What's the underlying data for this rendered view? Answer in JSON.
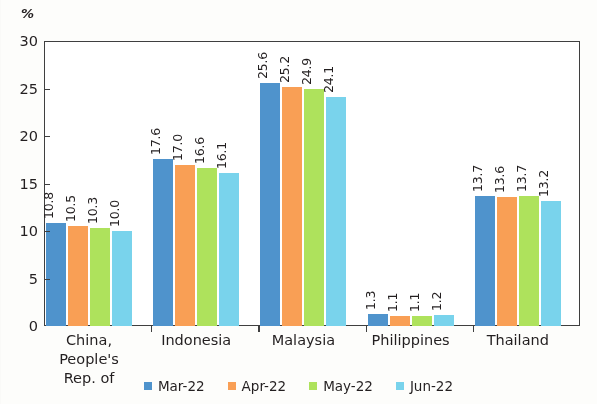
{
  "chart_data": {
    "type": "bar",
    "title": "",
    "subtitle": "",
    "xlabel": "",
    "ylabel": "%",
    "unit_label": "%",
    "ylim": [
      0,
      30
    ],
    "ytick_labels": [
      "0",
      "5",
      "10",
      "15",
      "20",
      "25",
      "30"
    ],
    "ytick_values": [
      0,
      5,
      10,
      15,
      20,
      25,
      30
    ],
    "grid": false,
    "legend_position": "bottom",
    "categories": [
      "China, People's Rep. of",
      "Indonesia",
      "Malaysia",
      "Philippines",
      "Thailand"
    ],
    "category_lines": [
      [
        "China, People's",
        "Rep. of"
      ],
      [
        "Indonesia"
      ],
      [
        "Malaysia"
      ],
      [
        "Philippines"
      ],
      [
        "Thailand"
      ]
    ],
    "series": [
      {
        "name": "Mar-22",
        "color": "#4f93cc",
        "values": [
          10.8,
          17.6,
          25.6,
          1.3,
          13.7
        ]
      },
      {
        "name": "Apr-22",
        "color": "#f99f55",
        "values": [
          10.5,
          17.0,
          25.2,
          1.1,
          13.6
        ]
      },
      {
        "name": "May-22",
        "color": "#aee25c",
        "values": [
          10.3,
          16.6,
          24.9,
          1.1,
          13.7
        ]
      },
      {
        "name": "Jun-22",
        "color": "#79d3ec",
        "values": [
          10.0,
          16.1,
          24.1,
          1.2,
          13.2
        ]
      }
    ],
    "value_labels": [
      [
        "10.8",
        "10.5",
        "10.3",
        "10.0"
      ],
      [
        "17.6",
        "17.0",
        "16.6",
        "16.1"
      ],
      [
        "25.6",
        "25.2",
        "24.9",
        "24.1"
      ],
      [
        "1.3",
        "1.1",
        "1.1",
        "1.2"
      ],
      [
        "13.7",
        "13.6",
        "13.7",
        "13.2"
      ]
    ],
    "colors": {
      "mar22": "#4f93cc",
      "apr22": "#f99f55",
      "may22": "#aee25c",
      "jun22": "#79d3ec",
      "axis": "#3f3f3f",
      "text": "#231f20",
      "background": "#ffffff"
    }
  },
  "legend": {
    "items": [
      {
        "label": "Mar-22"
      },
      {
        "label": "Apr-22"
      },
      {
        "label": "May-22"
      },
      {
        "label": "Jun-22"
      }
    ]
  }
}
